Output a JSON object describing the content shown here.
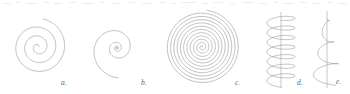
{
  "figure": {
    "background_color": "#ffffff",
    "stroke_color": "#8a8a8a",
    "axis_color": "#9a9a9a",
    "label_color": "#6a6a6a",
    "stroke_width": 0.55,
    "width": 350,
    "height": 94,
    "panels": [
      {
        "key": "a",
        "label": "a.",
        "name": "archimedean-spiral",
        "type": "archimedean-spiral",
        "center": {
          "x": 38,
          "y": 47
        },
        "turns": 3.15,
        "inner_radius": 0.6,
        "outer_radius": 28.5,
        "start_angle_deg": 25,
        "direction": "counterclockwise",
        "label_pos": {
          "x": 61,
          "y": 85
        }
      },
      {
        "key": "b",
        "label": "b.",
        "name": "logarithmic-spiral",
        "type": "logarithmic-spiral",
        "center": {
          "x": 117,
          "y": 48
        },
        "turns": 3.7,
        "inner_radius": 0.5,
        "outer_radius": 30,
        "growth": 1.62,
        "start_angle_deg": 20,
        "direction": "counterclockwise",
        "label_pos": {
          "x": 141,
          "y": 85
        }
      },
      {
        "key": "c",
        "label": "c.",
        "name": "dense-archimedean-spiral",
        "type": "archimedean-spiral",
        "center": {
          "x": 202,
          "y": 47
        },
        "turns": 11.2,
        "inner_radius": 0.5,
        "outer_radius": 37,
        "start_angle_deg": 10,
        "direction": "counterclockwise",
        "label_pos": {
          "x": 235,
          "y": 85
        }
      },
      {
        "key": "d",
        "label": "d.",
        "name": "cylindrical-helix",
        "type": "cylindrical-helix",
        "axis_x": 281,
        "axis_top": 12,
        "axis_bottom": 88,
        "coil_top": 16,
        "coil_bottom": 83,
        "radius_x": 14,
        "radius_y": 4.2,
        "turns": 7,
        "label_pos": {
          "x": 297,
          "y": 85
        }
      },
      {
        "key": "e",
        "label": "e.",
        "name": "conical-helix",
        "type": "conical-helix",
        "axis_x": 327,
        "axis_top": 11,
        "axis_bottom": 88,
        "coil_top": 15,
        "coil_bottom": 82,
        "radius_x_top": 1.5,
        "radius_x_bottom": 15,
        "radius_y": 4.0,
        "turns": 3.1,
        "label_pos": {
          "x": 336,
          "y": 84
        }
      }
    ],
    "scan_artifacts": {
      "description": "faint cropped text remnants along the top edge",
      "color": "#cfcfcf",
      "marks": [
        {
          "x": 4,
          "y": 3,
          "w": 7
        },
        {
          "x": 16,
          "y": 2,
          "w": 4
        },
        {
          "x": 26,
          "y": 3,
          "w": 10
        },
        {
          "x": 44,
          "y": 2,
          "w": 5
        },
        {
          "x": 54,
          "y": 3,
          "w": 8
        },
        {
          "x": 70,
          "y": 2,
          "w": 6
        },
        {
          "x": 82,
          "y": 3,
          "w": 12
        },
        {
          "x": 100,
          "y": 2,
          "w": 5
        },
        {
          "x": 112,
          "y": 3,
          "w": 9
        },
        {
          "x": 128,
          "y": 2,
          "w": 7
        },
        {
          "x": 142,
          "y": 3,
          "w": 11
        },
        {
          "x": 160,
          "y": 2,
          "w": 6
        },
        {
          "x": 172,
          "y": 3,
          "w": 4
        },
        {
          "x": 182,
          "y": 2,
          "w": 14
        },
        {
          "x": 202,
          "y": 3,
          "w": 6
        },
        {
          "x": 214,
          "y": 2,
          "w": 9
        },
        {
          "x": 230,
          "y": 3,
          "w": 5
        },
        {
          "x": 242,
          "y": 2,
          "w": 12
        },
        {
          "x": 260,
          "y": 3,
          "w": 7
        },
        {
          "x": 274,
          "y": 2,
          "w": 4
        },
        {
          "x": 284,
          "y": 3,
          "w": 10
        },
        {
          "x": 300,
          "y": 2,
          "w": 6
        },
        {
          "x": 312,
          "y": 3,
          "w": 8
        },
        {
          "x": 328,
          "y": 2,
          "w": 5
        },
        {
          "x": 338,
          "y": 3,
          "w": 9
        }
      ]
    }
  }
}
